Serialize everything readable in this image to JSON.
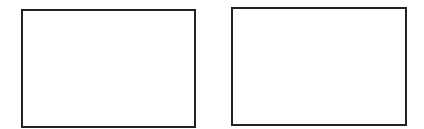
{
  "diagram": {
    "boxes": [
      {
        "id": "left",
        "label": "",
        "border_color": "#222222",
        "fill": "#ffffff"
      },
      {
        "id": "right",
        "label": "",
        "border_color": "#222222",
        "fill": "#ffffff"
      }
    ]
  }
}
